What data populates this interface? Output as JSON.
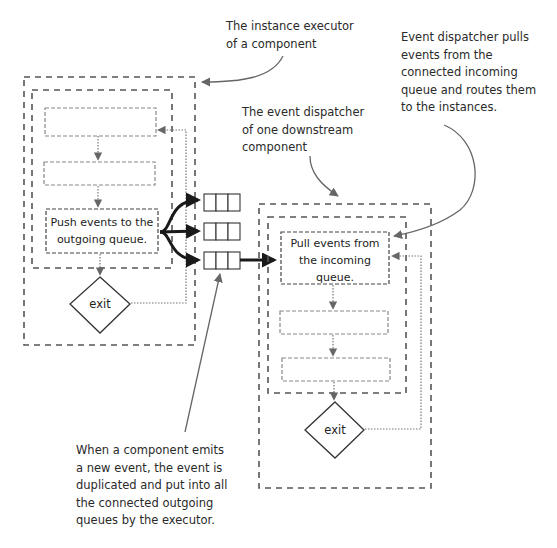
{
  "diagram": {
    "type": "flow-diagram",
    "annotations": [
      {
        "id": "executor-note",
        "text": "The instance executor\nof a component"
      },
      {
        "id": "dispatcher-note",
        "text": "The event dispatcher\nof one downstream\ncomponent"
      },
      {
        "id": "pull-note",
        "text": "Event dispatcher pulls\nevents from the\nconnected incoming\nqueue and routes them\nto the instances."
      },
      {
        "id": "duplicate-note",
        "text": "When a component emits\na new event, the event is\nduplicated and put into all\nthe connected outgoing\nqueues by the executor."
      }
    ],
    "left_component": {
      "label": "instance executor",
      "steps": [
        "",
        "",
        "Push events to the\noutgoing queue."
      ],
      "exit_label": "exit"
    },
    "queues": {
      "count": 3,
      "slots_per_queue": 3
    },
    "right_component": {
      "label": "event dispatcher",
      "steps": [
        "Pull events from\nthe incoming\nqueue.",
        "",
        ""
      ],
      "exit_label": "exit"
    },
    "colors": {
      "dash": "#555555",
      "arrow": "#666666",
      "bold_arrow": "#1a1a1a",
      "text": "#2a2a2a"
    }
  }
}
